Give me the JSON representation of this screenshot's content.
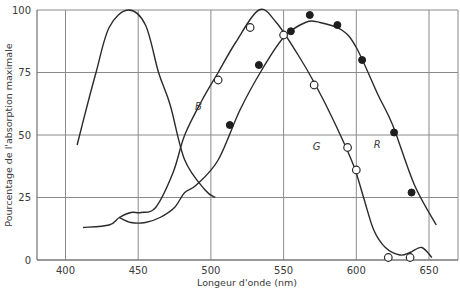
{
  "chart_data": {
    "type": "line",
    "title": "",
    "xlabel": "Longeur d'onde (nm)",
    "ylabel": "Pourcentage de l'absorption maximale",
    "xlim": [
      380,
      660
    ],
    "ylim": [
      0,
      100
    ],
    "x_ticks": [
      400,
      450,
      500,
      550,
      600,
      650
    ],
    "y_ticks": [
      0,
      25,
      50,
      75,
      100
    ],
    "grid": true,
    "legend": "inline curve labels",
    "series": [
      {
        "name": "B",
        "label_pos": [
          489,
          60
        ],
        "x": [
          408,
          415,
          421,
          430,
          443,
          455,
          464,
          472,
          482,
          496,
          503
        ],
        "y": [
          46,
          62,
          75,
          93,
          100,
          94,
          75,
          62,
          40,
          28,
          25
        ]
      },
      {
        "name": "G",
        "label_pos": [
          570,
          44
        ],
        "x": [
          412,
          430,
          437,
          445,
          452,
          462,
          474,
          482,
          494,
          505,
          517,
          533,
          545,
          560,
          572,
          585,
          598,
          605,
          612,
          620,
          630,
          637,
          645,
          652
        ],
        "y": [
          13,
          14,
          17,
          19,
          19,
          21,
          35,
          50,
          64,
          75,
          87,
          100,
          95,
          82,
          70,
          55,
          38,
          25,
          12,
          5,
          2,
          3,
          5,
          1
        ],
        "points_open": [
          [
            505,
            72
          ],
          [
            527,
            93
          ],
          [
            550,
            90
          ],
          [
            571,
            70
          ],
          [
            594,
            45
          ],
          [
            600,
            36
          ],
          [
            622,
            1
          ],
          [
            637,
            1
          ]
        ]
      },
      {
        "name": "R",
        "label_pos": [
          612,
          45
        ],
        "x": [
          437,
          445,
          455,
          465,
          475,
          482,
          490,
          505,
          520,
          535,
          550,
          565,
          575,
          590,
          600,
          615,
          625,
          640,
          655
        ],
        "y": [
          17,
          15,
          15,
          17,
          21,
          27,
          30,
          40,
          60,
          76,
          89,
          95,
          95,
          92,
          85,
          66,
          54,
          30,
          14
        ],
        "points_filled": [
          [
            513,
            54
          ],
          [
            533,
            78
          ],
          [
            555,
            91.5
          ],
          [
            568,
            98
          ],
          [
            587,
            94
          ],
          [
            604,
            80
          ],
          [
            626,
            51
          ],
          [
            638,
            27
          ]
        ]
      }
    ]
  },
  "axes": {
    "xlabel": "Longeur d'onde (nm)",
    "ylabel": "Pourcentage de l'absorption maximale",
    "x_tick_labels": [
      "400",
      "450",
      "500",
      "550",
      "600",
      "650"
    ],
    "y_tick_labels": [
      "0",
      "25",
      "50",
      "75",
      "100"
    ]
  },
  "labels": {
    "B": "B",
    "G": "G",
    "R": "R"
  },
  "colors": {
    "curve": "#2a2a2a",
    "grid": "#8a8a8a",
    "background": "#ffffff"
  }
}
